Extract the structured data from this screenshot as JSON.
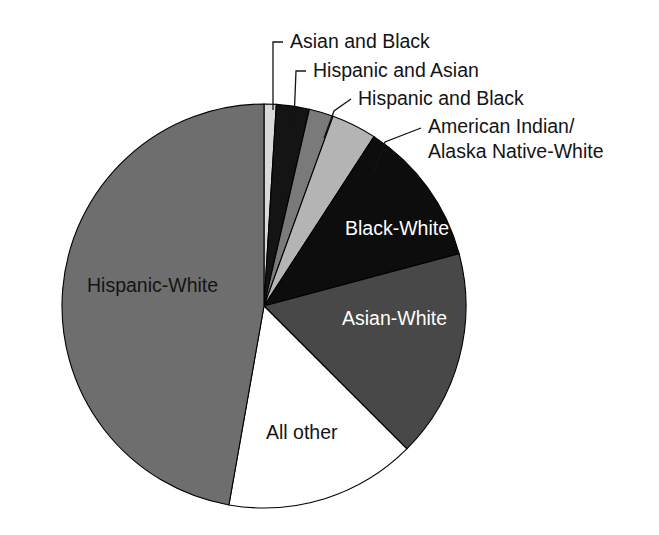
{
  "chart_data": {
    "type": "pie",
    "title": "",
    "subtitle": "",
    "xlabel": "",
    "ylabel": "",
    "legend_position": "none",
    "grid": false,
    "start_angle_deg": 0,
    "direction": "clockwise",
    "categories": [
      "Asian and Black",
      "Hispanic and Asian",
      "Hispanic and Black",
      "American Indian/ Alaska Native-White",
      "Black-White",
      "Asian-White",
      "All other",
      "Hispanic-White"
    ],
    "values": [
      1.0,
      2.6,
      1.9,
      3.6,
      11.7,
      16.7,
      15.3,
      47.2
    ],
    "colors": [
      "#d9d9d9",
      "#141414",
      "#7a7a7a",
      "#b4b4b4",
      "#0d0d0d",
      "#484848",
      "#ffffff",
      "#6e6e6e"
    ],
    "slices": [
      {
        "label": "Asian and Black",
        "value": 1.0,
        "start_deg": 0.0,
        "end_deg": 3.5,
        "color": "#d9d9d9",
        "label_placement": "callout"
      },
      {
        "label": "Hispanic and Asian",
        "value": 2.6,
        "start_deg": 3.5,
        "end_deg": 13.0,
        "color": "#141414",
        "label_placement": "callout"
      },
      {
        "label": "Hispanic and Black",
        "value": 1.9,
        "start_deg": 13.0,
        "end_deg": 20.0,
        "color": "#7a7a7a",
        "label_placement": "callout"
      },
      {
        "label": "American Indian/ Alaska Native-White",
        "value": 3.6,
        "start_deg": 20.0,
        "end_deg": 33.0,
        "color": "#b4b4b4",
        "label_placement": "callout"
      },
      {
        "label": "Black-White",
        "value": 11.7,
        "start_deg": 33.0,
        "end_deg": 75.0,
        "color": "#0d0d0d",
        "label_placement": "inside"
      },
      {
        "label": "Asian-White",
        "value": 16.7,
        "start_deg": 75.0,
        "end_deg": 135.0,
        "color": "#484848",
        "label_placement": "inside"
      },
      {
        "label": "All other",
        "value": 15.3,
        "start_deg": 135.0,
        "end_deg": 190.0,
        "color": "#ffffff",
        "label_placement": "inside"
      },
      {
        "label": "Hispanic-White",
        "value": 47.2,
        "start_deg": 190.0,
        "end_deg": 360.0,
        "color": "#6e6e6e",
        "label_placement": "inside"
      }
    ]
  },
  "callouts": [
    {
      "label": "Asian and Black",
      "text_x": 290,
      "text_y": 43
    },
    {
      "label": "Hispanic and Asian",
      "text_x": 313,
      "text_y": 72
    },
    {
      "label": "Hispanic and Black",
      "text_x": 358,
      "text_y": 100
    },
    {
      "label": "American Indian/",
      "text_x": 428,
      "text_y": 128
    },
    {
      "label": "Alaska Native-White",
      "text_x": 428,
      "text_y": 153
    }
  ],
  "inside_labels": [
    {
      "label": "Black-White",
      "x": 345,
      "y": 230,
      "tone": "light"
    },
    {
      "label": "Asian-White",
      "x": 342,
      "y": 320,
      "tone": "light"
    },
    {
      "label": "All other",
      "x": 266,
      "y": 434,
      "tone": "dark"
    },
    {
      "label": "Hispanic-White",
      "x": 87,
      "y": 287,
      "tone": "dark"
    }
  ],
  "geometry": {
    "center_x": 264,
    "center_y": 306,
    "radius": 202
  }
}
